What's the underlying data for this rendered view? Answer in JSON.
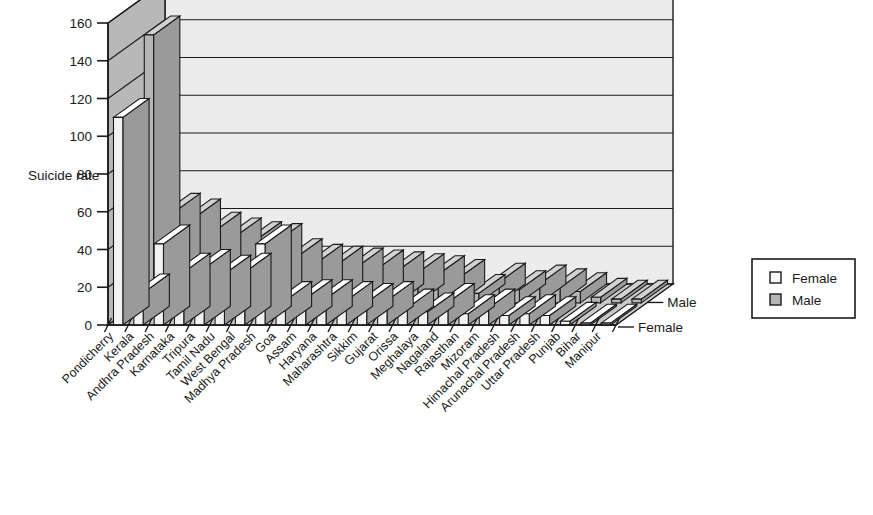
{
  "chart_data": {
    "type": "bar",
    "title": "",
    "subtitle": "",
    "xlabel": "",
    "ylabel": "Suicide rate",
    "zlabel": "",
    "ylim": [
      0,
      160
    ],
    "ytick_step": 20,
    "yticks": [
      "0",
      "20",
      "40",
      "60",
      "80",
      "100",
      "120",
      "140",
      "160"
    ],
    "grid": true,
    "three_d": true,
    "legend_position": "right",
    "depth_axis_labels": [
      "Male",
      "Female"
    ],
    "categories": [
      "Pondicherry",
      "Kerala",
      "Andhra Pradesh",
      "Karnataka",
      "Tripura",
      "Tamil Nadu",
      "West Bengal",
      "Madhya Pradesh",
      "Goa",
      "Assam",
      "Haryana",
      "Maharashtra",
      "Sikkim",
      "Gujarat",
      "Orissa",
      "Meghalaya",
      "Nagaland",
      "Rajasthan",
      "Mizoram",
      "Himachal Pradesh",
      "Arunachal Pradesh",
      "Uttar Pradesh",
      "Punjab",
      "Bihar",
      "Manipur"
    ],
    "series": [
      {
        "name": "Female",
        "color": "#f2f2f2",
        "values": [
          110,
          17,
          43,
          28,
          30,
          27,
          28,
          43,
          13,
          14,
          14,
          13,
          12,
          13,
          9,
          7,
          12,
          6,
          9,
          5,
          6,
          5,
          2,
          1,
          1
        ]
      },
      {
        "name": "Male",
        "color": "#b5b5b5",
        "values": [
          142,
          48,
          45,
          38,
          35,
          33,
          32,
          24,
          21,
          20,
          19,
          18,
          17,
          16,
          15,
          13,
          5,
          11,
          7,
          10,
          8,
          6,
          3,
          2,
          2
        ]
      }
    ]
  },
  "legend": {
    "items": [
      {
        "label": "Female",
        "swatch": "#f7f7f7"
      },
      {
        "label": "Male",
        "swatch": "#b5b5b5"
      }
    ]
  },
  "colors": {
    "wall_back": "#ececec",
    "wall_side": "#b8b8b8",
    "floor": "#c9c9c9",
    "outline": "#1a1a1a"
  }
}
